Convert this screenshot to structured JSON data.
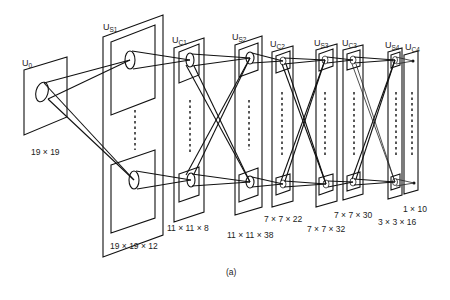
{
  "figure": {
    "caption": "(a)",
    "layers": [
      {
        "id": "u0",
        "label_main": "U",
        "label_sub": "0",
        "dims": "19 × 19"
      },
      {
        "id": "us1",
        "label_main": "U",
        "label_sub": "S1",
        "dims": "19 × 19 × 12"
      },
      {
        "id": "uc1",
        "label_main": "U",
        "label_sub": "C1",
        "dims": "11 × 11 × 8"
      },
      {
        "id": "us2",
        "label_main": "U",
        "label_sub": "S2",
        "dims": "11 × 11 × 38"
      },
      {
        "id": "uc2",
        "label_main": "U",
        "label_sub": "C2",
        "dims": "7 × 7 × 22"
      },
      {
        "id": "us3",
        "label_main": "U",
        "label_sub": "S3",
        "dims": "7 × 7 × 32"
      },
      {
        "id": "uc3",
        "label_main": "U",
        "label_sub": "C3",
        "dims": "7 × 7 × 30"
      },
      {
        "id": "us4",
        "label_main": "U",
        "label_sub": "S4",
        "dims": "3 × 3 × 16"
      },
      {
        "id": "uc4",
        "label_main": "U",
        "label_sub": "C4",
        "dims": "1 × 10"
      }
    ]
  }
}
